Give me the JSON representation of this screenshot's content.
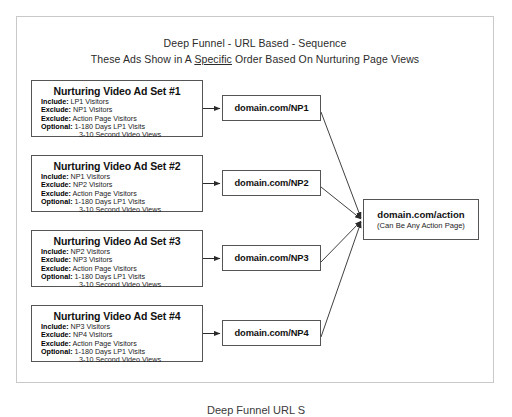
{
  "slide": {
    "title_line1": "Deep Funnel - URL Based - Sequence",
    "title_line2_before": "These Ads Show in A ",
    "title_line2_emphasis": "Specific",
    "title_line2_after": " Order Based On Nurturing Page Views",
    "bottom_caption": "Deep Funnel URL S"
  },
  "colors": {
    "frame_border": "#c9c9c9",
    "box_border": "#555555",
    "box_fill": "#ffffff",
    "connector": "#3a3a3a",
    "text": "#1a1a1a",
    "background": "#ffffff"
  },
  "ad_sets": [
    {
      "title": "Nurturing Video Ad Set #1",
      "rows": [
        {
          "label": "Include:",
          "value": " LP1 Visitors"
        },
        {
          "label": "Exclude:",
          "value": " NP1 Visitors"
        },
        {
          "label": "Exclude:",
          "value": " Action Page Visitors"
        },
        {
          "label": "Optional:",
          "value": " 1-180 Days LP1 Visits"
        }
      ],
      "continuation": "3-10 Second Video Views"
    },
    {
      "title": "Nurturing Video Ad Set #2",
      "rows": [
        {
          "label": "Include:",
          "value": " NP1 Visitors"
        },
        {
          "label": "Exclude:",
          "value": " NP2 Visitors"
        },
        {
          "label": "Exclude:",
          "value": " Action Page Visitors"
        },
        {
          "label": "Optional:",
          "value": " 1-180 Days LP1 Visits"
        }
      ],
      "continuation": "3-10 Second Video Views"
    },
    {
      "title": "Nurturing Video Ad Set #3",
      "rows": [
        {
          "label": "Include:",
          "value": " NP2 Visitors"
        },
        {
          "label": "Exclude:",
          "value": " NP3 Visitors"
        },
        {
          "label": "Exclude:",
          "value": " Action Page Visitors"
        },
        {
          "label": "Optional:",
          "value": " 1-180 Days LP1 Visits"
        }
      ],
      "continuation": "3-10 Second Video Views"
    },
    {
      "title": "Nurturing Video Ad Set #4",
      "rows": [
        {
          "label": "Include:",
          "value": " NP3 Visitors"
        },
        {
          "label": "Exclude:",
          "value": " NP4 Visitors"
        },
        {
          "label": "Exclude:",
          "value": " Action Page Visitors"
        },
        {
          "label": "Optional:",
          "value": " 1-180 Days LP1 Visits"
        }
      ],
      "continuation": "3-10 Second Video Views"
    }
  ],
  "page_boxes": [
    {
      "label": "domain.com/NP1"
    },
    {
      "label": "domain.com/NP2"
    },
    {
      "label": "domain.com/NP3"
    },
    {
      "label": "domain.com/NP4"
    }
  ],
  "action_node": {
    "title": "domain.com/action",
    "subtitle": "(Can Be Any Action Page)"
  }
}
